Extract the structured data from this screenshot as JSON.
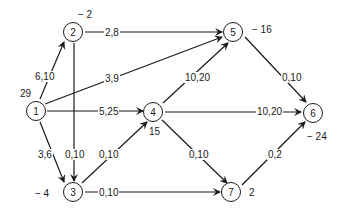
{
  "diagram": {
    "type": "network-flow",
    "nodes": [
      {
        "id": "1",
        "label": "1",
        "supply": "29"
      },
      {
        "id": "2",
        "label": "2",
        "supply": "− 2"
      },
      {
        "id": "3",
        "label": "3",
        "supply": "− 4"
      },
      {
        "id": "4",
        "label": "4",
        "supply": "15"
      },
      {
        "id": "5",
        "label": "5",
        "supply": "− 16"
      },
      {
        "id": "6",
        "label": "6",
        "supply": "− 24"
      },
      {
        "id": "7",
        "label": "7",
        "supply": "2"
      }
    ],
    "edges": [
      {
        "from": "1",
        "to": "2",
        "label": "6,10"
      },
      {
        "from": "1",
        "to": "5",
        "label": "3,9"
      },
      {
        "from": "1",
        "to": "4",
        "label": "5,25"
      },
      {
        "from": "1",
        "to": "3",
        "label": "3,6"
      },
      {
        "from": "2",
        "to": "5",
        "label": "2,8"
      },
      {
        "from": "2",
        "to": "3",
        "label": "0,10"
      },
      {
        "from": "3",
        "to": "4",
        "label": "0,10"
      },
      {
        "from": "3",
        "to": "7",
        "label": "0,10"
      },
      {
        "from": "4",
        "to": "5",
        "label": "10,20"
      },
      {
        "from": "4",
        "to": "6",
        "label": "10,20"
      },
      {
        "from": "4",
        "to": "7",
        "label": "0,10"
      },
      {
        "from": "5",
        "to": "6",
        "label": "0,10"
      },
      {
        "from": "7",
        "to": "6",
        "label": "0,2"
      }
    ]
  }
}
